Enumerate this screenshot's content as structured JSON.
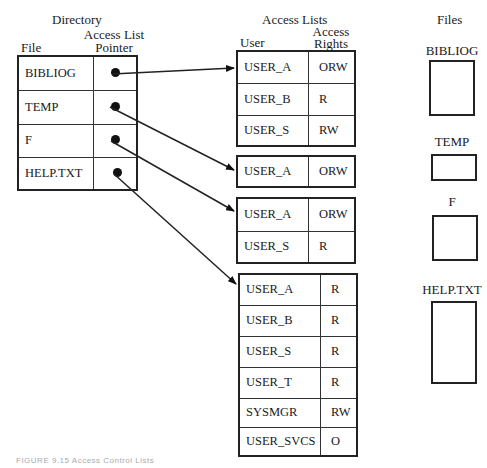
{
  "directory": {
    "title": "Directory",
    "col_file": "File",
    "col_pointer_line1": "Access List",
    "col_pointer_line2": "Pointer",
    "entries": [
      {
        "file": "BIBLIOG"
      },
      {
        "file": "TEMP"
      },
      {
        "file": "F"
      },
      {
        "file": "HELP.TXT"
      }
    ]
  },
  "access_lists": {
    "title": "Access Lists",
    "col_user": "User",
    "col_rights_line1": "Access",
    "col_rights_line2": "Rights",
    "lists": [
      {
        "for_file": "BIBLIOG",
        "rows": [
          {
            "user": "USER_A",
            "rights": "ORW"
          },
          {
            "user": "USER_B",
            "rights": "R"
          },
          {
            "user": "USER_S",
            "rights": "RW"
          }
        ]
      },
      {
        "for_file": "TEMP",
        "rows": [
          {
            "user": "USER_A",
            "rights": "ORW"
          }
        ]
      },
      {
        "for_file": "F",
        "rows": [
          {
            "user": "USER_A",
            "rights": "ORW"
          },
          {
            "user": "USER_S",
            "rights": "R"
          }
        ]
      },
      {
        "for_file": "HELP.TXT",
        "rows": [
          {
            "user": "USER_A",
            "rights": "R"
          },
          {
            "user": "USER_B",
            "rights": "R"
          },
          {
            "user": "USER_S",
            "rights": "R"
          },
          {
            "user": "USER_T",
            "rights": "R"
          },
          {
            "user": "SYSMGR",
            "rights": "RW"
          },
          {
            "user": "USER_SVCS",
            "rights": "O"
          }
        ]
      }
    ]
  },
  "files": {
    "title": "Files",
    "items": [
      {
        "name": "BIBLIOG"
      },
      {
        "name": "TEMP"
      },
      {
        "name": "F"
      },
      {
        "name": "HELP.TXT"
      }
    ]
  },
  "caption": "FIGURE 9.15  Access Control Lists"
}
